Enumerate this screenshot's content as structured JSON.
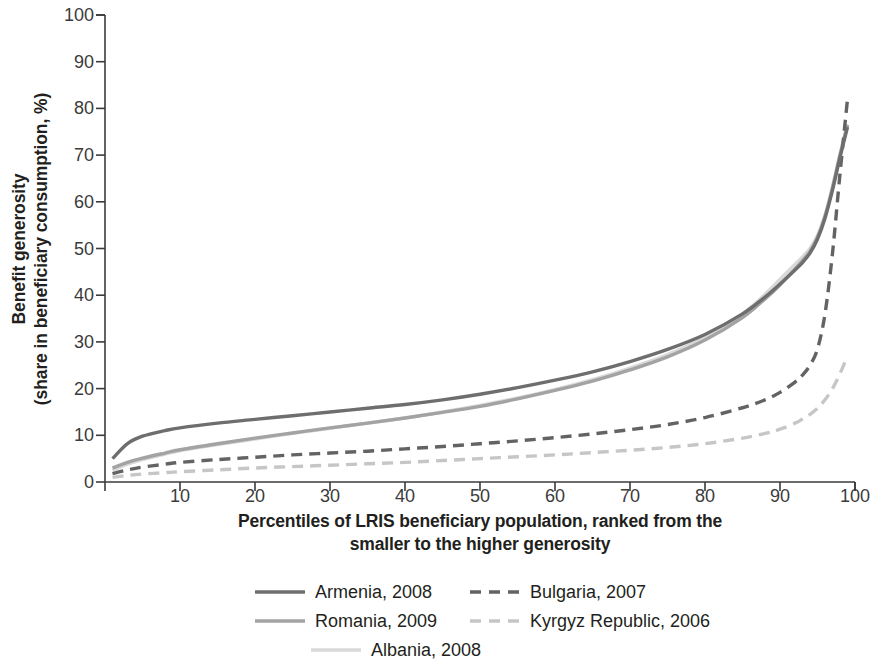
{
  "axes": {
    "ylabel_line1": "Benefit generosity",
    "ylabel_line2": "(share in beneficiary consumption, %)",
    "xlabel_line1": "Percentiles of LRIS beneficiary population, ranked from the",
    "xlabel_line2": "smaller to the higher generosity",
    "yticks": [
      "0",
      "10",
      "20",
      "30",
      "40",
      "50",
      "60",
      "70",
      "80",
      "90",
      "100"
    ],
    "xticks": [
      "10",
      "20",
      "30",
      "40",
      "50",
      "60",
      "70",
      "80",
      "90",
      "100"
    ]
  },
  "legend": {
    "items": [
      {
        "label": "Armenia, 2008",
        "key": "armenia"
      },
      {
        "label": "Bulgaria, 2007",
        "key": "bulgaria"
      },
      {
        "label": "Romania, 2009",
        "key": "romania"
      },
      {
        "label": "Kyrgyz Republic, 2006",
        "key": "kyrgyz"
      },
      {
        "label": "Albania, 2008",
        "key": "albania"
      }
    ]
  },
  "chart_data": {
    "type": "line",
    "title": "",
    "xlabel": "Percentiles of LRIS beneficiary population, ranked from the smaller to the higher generosity",
    "ylabel": "Benefit generosity (share in beneficiary consumption, %)",
    "xlim": [
      0,
      100
    ],
    "ylim": [
      0,
      100
    ],
    "xticks": [
      0,
      10,
      20,
      30,
      40,
      50,
      60,
      70,
      80,
      90,
      100
    ],
    "yticks": [
      0,
      10,
      20,
      30,
      40,
      50,
      60,
      70,
      80,
      90,
      100
    ],
    "grid": false,
    "legend_position": "below",
    "x": [
      1,
      3,
      5,
      8,
      10,
      15,
      20,
      25,
      30,
      35,
      40,
      45,
      50,
      55,
      60,
      65,
      70,
      75,
      80,
      85,
      88,
      90,
      92,
      93,
      94,
      95,
      96,
      97,
      98,
      99
    ],
    "series": [
      {
        "name": "Armenia, 2008",
        "color": "#6e6e6e",
        "style": "solid",
        "values": [
          5.0,
          8.2,
          9.8,
          11.0,
          11.6,
          12.6,
          13.4,
          14.2,
          15.0,
          15.8,
          16.6,
          17.6,
          18.8,
          20.2,
          21.8,
          23.6,
          25.8,
          28.4,
          31.6,
          36.0,
          39.6,
          42.4,
          45.4,
          47.0,
          49.0,
          52.0,
          56.5,
          62.5,
          69.5,
          76.0
        ]
      },
      {
        "name": "Bulgaria, 2007",
        "color": "#636363",
        "style": "dashed",
        "values": [
          1.8,
          2.6,
          3.2,
          3.8,
          4.2,
          4.8,
          5.3,
          5.8,
          6.2,
          6.6,
          7.1,
          7.6,
          8.2,
          8.8,
          9.5,
          10.3,
          11.2,
          12.3,
          13.8,
          15.9,
          17.6,
          19.2,
          21.4,
          22.9,
          25.0,
          28.5,
          36.0,
          49.0,
          66.0,
          82.0
        ]
      },
      {
        "name": "Romania, 2009",
        "color": "#a3a3a3",
        "style": "solid",
        "values": [
          3.0,
          4.2,
          5.1,
          6.2,
          6.9,
          8.2,
          9.4,
          10.5,
          11.6,
          12.6,
          13.7,
          14.9,
          16.2,
          17.8,
          19.6,
          21.6,
          24.0,
          26.8,
          30.4,
          35.2,
          39.2,
          42.2,
          45.6,
          47.4,
          49.4,
          52.4,
          56.9,
          63.0,
          70.0,
          76.5
        ]
      },
      {
        "name": "Kyrgyz Republic, 2006",
        "color": "#c6c6c6",
        "style": "dashed",
        "values": [
          1.0,
          1.4,
          1.7,
          2.0,
          2.2,
          2.6,
          3.0,
          3.3,
          3.6,
          3.9,
          4.2,
          4.6,
          5.0,
          5.4,
          5.8,
          6.3,
          6.8,
          7.4,
          8.2,
          9.4,
          10.4,
          11.3,
          12.6,
          13.5,
          14.5,
          15.8,
          17.6,
          20.0,
          23.2,
          27.0
        ]
      },
      {
        "name": "Albania, 2008",
        "color": "#d9d9d9",
        "style": "solid",
        "values": [
          2.5,
          3.8,
          4.8,
          6.0,
          6.7,
          8.0,
          9.2,
          10.4,
          11.5,
          12.6,
          13.7,
          15.0,
          16.4,
          18.0,
          19.8,
          21.9,
          24.4,
          27.3,
          31.0,
          36.0,
          40.2,
          43.4,
          46.6,
          48.2,
          50.0,
          52.8,
          57.2,
          63.2,
          70.2,
          76.5
        ]
      }
    ]
  }
}
